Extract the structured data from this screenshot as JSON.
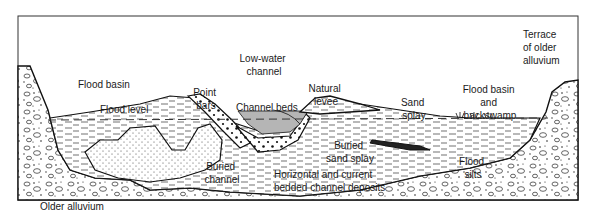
{
  "diagram": {
    "type": "geologic-cross-section",
    "labels": {
      "low_water_channel": [
        "Low-water",
        "channel"
      ],
      "terrace": [
        "Terrace",
        "of older",
        "alluvium"
      ],
      "flood_basin": "Flood basin",
      "flood_level": "Flood level",
      "point_bars": [
        "Point",
        "bars"
      ],
      "channel_beds": "Channel beds",
      "natural_levee": [
        "Natural",
        "levee"
      ],
      "sand_splay": [
        "Sand",
        "splay"
      ],
      "flood_basin_backswamp": [
        "Flood basin",
        "and",
        "backswamp"
      ],
      "buried_channel": [
        "Buried",
        "channel"
      ],
      "buried_sand_splay": [
        "Buried",
        "sand splay"
      ],
      "horizontal_deposits": [
        "Horizontal and current",
        "bedded channel deposits"
      ],
      "flood_silts": [
        "Flood",
        "silts"
      ],
      "older_alluvium": "Older alluvium"
    },
    "colors": {
      "line": "#1a1a1a",
      "water": "#b5b5b5",
      "background": "#ffffff"
    }
  }
}
